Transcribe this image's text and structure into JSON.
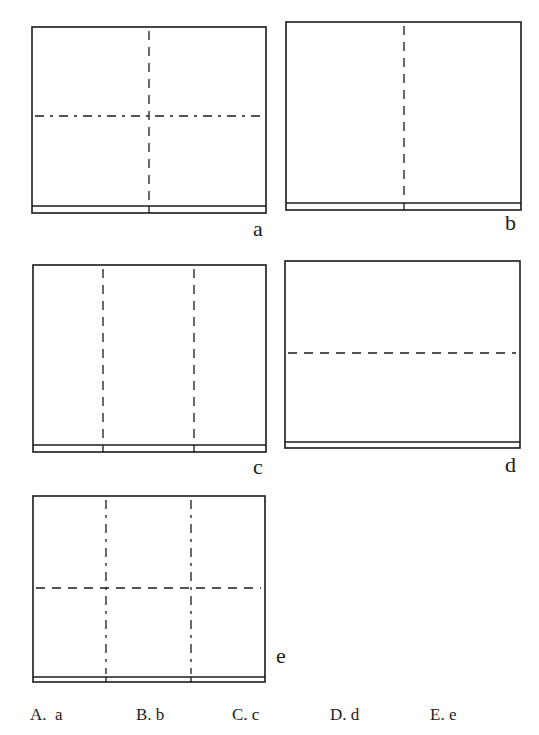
{
  "panels": [
    {
      "id": "a",
      "label": "a",
      "box": [
        32,
        27,
        266,
        213
      ],
      "inner_line_y": 206,
      "vertical_folds": [
        149
      ],
      "horizontal_folds": [
        116
      ],
      "horizontal_style": "dash-dot",
      "vertical_style": "dashed",
      "label_pos": [
        253,
        218
      ]
    },
    {
      "id": "b",
      "label": "b",
      "box": [
        286,
        22,
        521,
        210
      ],
      "inner_line_y": 203,
      "vertical_folds": [
        404
      ],
      "horizontal_folds": [],
      "horizontal_style": "dashed",
      "vertical_style": "dashed",
      "label_pos": [
        505,
        212
      ]
    },
    {
      "id": "c",
      "label": "c",
      "box": [
        33,
        265,
        266,
        452
      ],
      "inner_line_y": 445,
      "vertical_folds": [
        103,
        194
      ],
      "horizontal_folds": [],
      "horizontal_style": "dashed",
      "vertical_style": "dashed",
      "label_pos": [
        253,
        456
      ]
    },
    {
      "id": "d",
      "label": "d",
      "box": [
        285,
        261,
        520,
        448
      ],
      "inner_line_y": 442,
      "vertical_folds": [],
      "horizontal_folds": [
        353
      ],
      "horizontal_style": "dashed",
      "vertical_style": "dashed",
      "label_pos": [
        505,
        454
      ]
    },
    {
      "id": "e",
      "label": "e",
      "box": [
        33,
        496,
        265,
        682
      ],
      "inner_line_y": 677,
      "vertical_folds": [
        106,
        191
      ],
      "horizontal_folds": [
        588
      ],
      "horizontal_style": "dashed",
      "vertical_style": "dash-dot",
      "label_pos": [
        276,
        645
      ]
    }
  ],
  "options": [
    {
      "key": "A",
      "text": "A.  a",
      "x": 30
    },
    {
      "key": "B",
      "text": "B. b",
      "x": 136
    },
    {
      "key": "C",
      "text": "C. c",
      "x": 232
    },
    {
      "key": "D",
      "text": "D. d",
      "x": 330
    },
    {
      "key": "E",
      "text": "E. e",
      "x": 430
    }
  ],
  "colors": {
    "line": "#1a1a1a",
    "background": "#ffffff"
  }
}
